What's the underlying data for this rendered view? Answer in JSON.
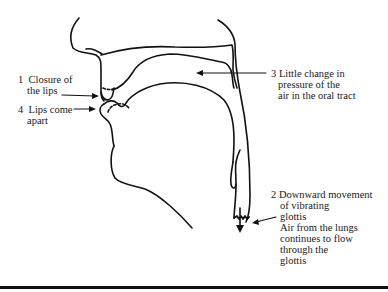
{
  "diagram": {
    "stroke_color": "#111111",
    "labels": [
      {
        "id": "label-1",
        "number": "1",
        "lines": [
          "Closure of",
          "the lips"
        ]
      },
      {
        "id": "label-4",
        "number": "4",
        "lines": [
          "Lips come",
          "apart"
        ]
      },
      {
        "id": "label-3",
        "number": "3",
        "lines": [
          "Little change in",
          "pressure of the",
          "air in the oral tract"
        ]
      },
      {
        "id": "label-2",
        "number": "2",
        "lines": [
          "Downward movement",
          "of vibrating",
          "glottis",
          "Air from the lungs",
          "continues to flow",
          "through the",
          "glottis"
        ]
      }
    ]
  }
}
